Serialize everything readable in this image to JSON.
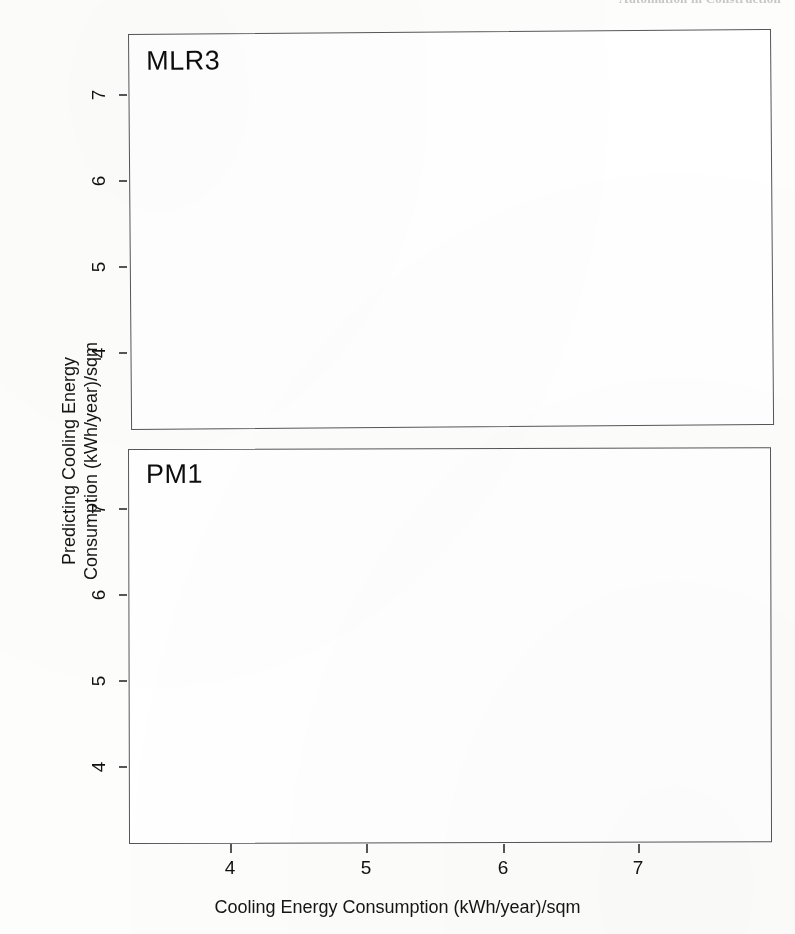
{
  "header": {
    "running_text": "Automation in Construction"
  },
  "axes": {
    "x_title": "Cooling Energy Consumption (kWh/year)/sqm",
    "y_title": "Predicting Cooling Energy\nConsumption (kWh/year)/sqm",
    "x_ticks": [
      "4",
      "5",
      "6",
      "7"
    ],
    "y_ticks": [
      "4",
      "5",
      "6",
      "7"
    ]
  },
  "panels": [
    {
      "tag": "MLR3"
    },
    {
      "tag": "PM1"
    }
  ],
  "chart_data": {
    "type": "scatter",
    "title": "",
    "xlabel": "Cooling Energy Consumption (kWh/year)/sqm",
    "ylabel": "Predicting Cooling Energy Consumption (kWh/year)/sqm",
    "xlim": [
      3.25,
      7.85
    ],
    "ylim": [
      3.25,
      7.85
    ],
    "xticks": [
      4,
      5,
      6,
      7
    ],
    "yticks": [
      4,
      7
    ],
    "grid": false,
    "legend": null,
    "marker": "open-circle",
    "reference_line": {
      "type": "identity",
      "slope": 1,
      "intercept": 0,
      "label": "1:1 line"
    },
    "panels": [
      {
        "name": "MLR3",
        "label": "MLR3",
        "yticks": [
          4,
          5,
          6,
          7
        ],
        "n_points": 6000,
        "scatter_spread": "wide",
        "residual_sd": 0.105,
        "description": "Dense cloud of open circles scattered about the 1:1 line; band widens markedly toward the upper right where points flatten near y = 7.3-7.5.",
        "x_range": [
          3.35,
          7.75
        ],
        "y_range": [
          3.4,
          7.55
        ],
        "sample_points": [
          [
            3.4,
            3.45
          ],
          [
            3.55,
            3.52
          ],
          [
            3.7,
            3.74
          ],
          [
            3.85,
            3.88
          ],
          [
            4.0,
            4.05
          ],
          [
            4.2,
            4.14
          ],
          [
            4.4,
            4.46
          ],
          [
            4.6,
            4.55
          ],
          [
            4.8,
            4.86
          ],
          [
            5.0,
            4.96
          ],
          [
            5.2,
            5.27
          ],
          [
            5.4,
            5.35
          ],
          [
            5.6,
            5.66
          ],
          [
            5.8,
            5.75
          ],
          [
            6.0,
            6.07
          ],
          [
            6.2,
            6.14
          ],
          [
            6.4,
            6.48
          ],
          [
            6.6,
            6.55
          ],
          [
            6.8,
            6.89
          ],
          [
            7.0,
            6.95
          ],
          [
            7.2,
            7.24
          ],
          [
            7.4,
            7.3
          ],
          [
            7.6,
            7.38
          ],
          [
            7.75,
            7.44
          ]
        ]
      },
      {
        "name": "PM1",
        "label": "PM1",
        "yticks": [
          4,
          5,
          6,
          7
        ],
        "n_points": 6000,
        "scatter_spread": "tight",
        "residual_sd": 0.018,
        "description": "Points form an extremely tight, nearly continuous band lying on the 1:1 line from lower-left to upper-right corner, indicating near-perfect prediction.",
        "x_range": [
          3.3,
          7.8
        ],
        "y_range": [
          3.3,
          7.8
        ],
        "sample_points": [
          [
            3.35,
            3.34
          ],
          [
            3.7,
            3.71
          ],
          [
            4.0,
            4.0
          ],
          [
            4.3,
            4.31
          ],
          [
            4.6,
            4.59
          ],
          [
            5.0,
            5.01
          ],
          [
            5.3,
            5.29
          ],
          [
            5.6,
            5.61
          ],
          [
            6.0,
            6.0
          ],
          [
            6.3,
            6.31
          ],
          [
            6.6,
            6.59
          ],
          [
            7.0,
            7.01
          ],
          [
            7.3,
            7.29
          ],
          [
            7.6,
            7.61
          ],
          [
            7.78,
            7.78
          ]
        ]
      }
    ]
  }
}
